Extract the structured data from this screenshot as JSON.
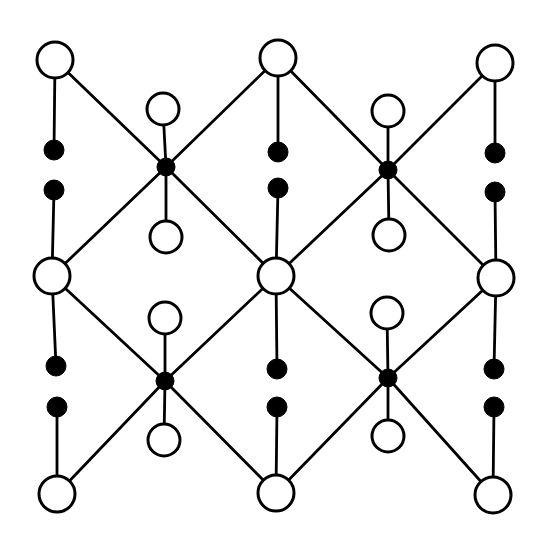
{
  "diagram": {
    "type": "lattice-structure",
    "colors": {
      "stroke": "#000000",
      "background": "#ffffff",
      "open_fill": "#ffffff",
      "filled": "#000000"
    },
    "sizes": {
      "large_open_r": 18,
      "small_open_r": 16,
      "junction_r": 9,
      "dot_r": 10
    },
    "nodes": {
      "large_open": [
        {
          "id": "L00",
          "x": 55,
          "y": 60
        },
        {
          "id": "L01",
          "x": 278,
          "y": 58
        },
        {
          "id": "L02",
          "x": 495,
          "y": 63
        },
        {
          "id": "L10",
          "x": 52,
          "y": 276
        },
        {
          "id": "L11",
          "x": 276,
          "y": 276
        },
        {
          "id": "L12",
          "x": 496,
          "y": 278
        },
        {
          "id": "L20",
          "x": 57,
          "y": 494
        },
        {
          "id": "L21",
          "x": 276,
          "y": 493
        },
        {
          "id": "L22",
          "x": 493,
          "y": 495
        }
      ],
      "junctions": [
        {
          "id": "J0",
          "x": 166,
          "y": 167
        },
        {
          "id": "J1",
          "x": 388,
          "y": 170
        },
        {
          "id": "J2",
          "x": 165,
          "y": 381
        },
        {
          "id": "J3",
          "x": 388,
          "y": 378
        }
      ],
      "small_open": [
        {
          "id": "S0a",
          "x": 163,
          "y": 109,
          "attach": "J0"
        },
        {
          "id": "S0b",
          "x": 166,
          "y": 237,
          "attach": "J0"
        },
        {
          "id": "S1a",
          "x": 388,
          "y": 111,
          "attach": "J1"
        },
        {
          "id": "S1b",
          "x": 389,
          "y": 235,
          "attach": "J1"
        },
        {
          "id": "S2a",
          "x": 165,
          "y": 318,
          "attach": "J2"
        },
        {
          "id": "S2b",
          "x": 164,
          "y": 440,
          "attach": "J2"
        },
        {
          "id": "S3a",
          "x": 387,
          "y": 313,
          "attach": "J3"
        },
        {
          "id": "S3b",
          "x": 388,
          "y": 436,
          "attach": "J3"
        }
      ],
      "dots": [
        {
          "id": "D00a",
          "x": 54,
          "y": 150,
          "attach": "L00"
        },
        {
          "id": "D00b",
          "x": 54,
          "y": 190,
          "attach": "L10"
        },
        {
          "id": "D01a",
          "x": 278,
          "y": 152,
          "attach": "L01"
        },
        {
          "id": "D01b",
          "x": 278,
          "y": 188,
          "attach": "L11"
        },
        {
          "id": "D02a",
          "x": 495,
          "y": 153,
          "attach": "L02"
        },
        {
          "id": "D02b",
          "x": 495,
          "y": 192,
          "attach": "L12"
        },
        {
          "id": "D10a",
          "x": 56,
          "y": 366,
          "attach": "L10"
        },
        {
          "id": "D10b",
          "x": 57,
          "y": 407,
          "attach": "L20"
        },
        {
          "id": "D11a",
          "x": 277,
          "y": 369,
          "attach": "L11"
        },
        {
          "id": "D11b",
          "x": 277,
          "y": 407,
          "attach": "L21"
        },
        {
          "id": "D12a",
          "x": 494,
          "y": 369,
          "attach": "L12"
        },
        {
          "id": "D12b",
          "x": 494,
          "y": 407,
          "attach": "L22"
        }
      ]
    },
    "diagonal_bonds": [
      [
        "L00",
        "J0"
      ],
      [
        "L01",
        "J0"
      ],
      [
        "L10",
        "J0"
      ],
      [
        "L11",
        "J0"
      ],
      [
        "L01",
        "J1"
      ],
      [
        "L02",
        "J1"
      ],
      [
        "L11",
        "J1"
      ],
      [
        "L12",
        "J1"
      ],
      [
        "L10",
        "J2"
      ],
      [
        "L11",
        "J2"
      ],
      [
        "L20",
        "J2"
      ],
      [
        "L21",
        "J2"
      ],
      [
        "L11",
        "J3"
      ],
      [
        "L12",
        "J3"
      ],
      [
        "L21",
        "J3"
      ],
      [
        "L22",
        "J3"
      ]
    ]
  }
}
